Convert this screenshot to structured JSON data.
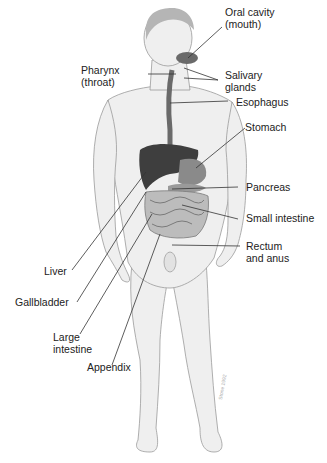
{
  "labels": {
    "oral_cavity": [
      "Oral cavity",
      "(mouth)"
    ],
    "pharynx": [
      "Pharynx",
      "(throat)"
    ],
    "salivary_glands": [
      "Salivary",
      "glands"
    ],
    "esophagus": "Esophagus",
    "stomach": "Stomach",
    "pancreas": "Pancreas",
    "small_intestine": "Small intestine",
    "rectum_anus": [
      "Rectum",
      "and anus"
    ],
    "liver": "Liver",
    "gallbladder": "Gallbladder",
    "large_intestine": [
      "Large",
      "intestine"
    ],
    "appendix": "Appendix"
  },
  "colors": {
    "skin": "#eeeeee",
    "outline": "#8a8a8a",
    "organ_dark": "#4a4a4a",
    "organ_mid": "#8c8c8c",
    "leader_line": "#333333"
  }
}
